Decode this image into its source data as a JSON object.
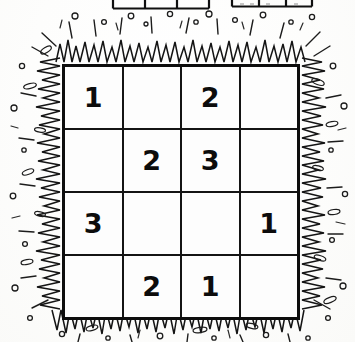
{
  "page": {
    "kind": "scanned-puzzle-page",
    "background_color": "#fefefe",
    "ink_color": "#0d0d0d"
  },
  "cut_tables": {
    "description": "two partially visible tables cut off at the top edge of the page",
    "tables": [
      {
        "name": "left-cut-table",
        "x": 113,
        "width": 96,
        "columns": 3,
        "cells": [
          "",
          "",
          ""
        ]
      },
      {
        "name": "right-cut-table",
        "x": 232,
        "width": 80,
        "columns": 3,
        "cells": [
          "",
          "",
          ""
        ]
      }
    ]
  },
  "puzzle": {
    "title": "",
    "rows": 4,
    "columns": 4,
    "grid": [
      [
        "1",
        "",
        "2",
        ""
      ],
      [
        "",
        "2",
        "3",
        ""
      ],
      [
        "3",
        "",
        "",
        "1"
      ],
      [
        "",
        "2",
        "1",
        ""
      ]
    ]
  },
  "decoration": {
    "style": "hand-drawn starburst zigzag frame with scattered circles, ovals and dashes",
    "stroke_color": "#1a1a1a"
  }
}
